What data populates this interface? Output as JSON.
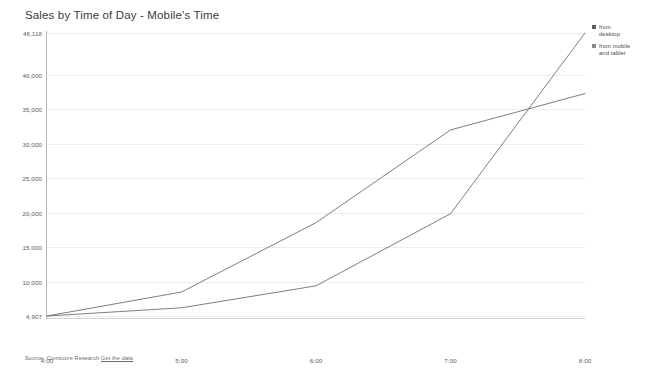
{
  "chart_data": {
    "type": "line",
    "title": "Sales by Time of Day - Mobile's Time",
    "xlabel": "",
    "ylabel": "",
    "x": [
      "4:00",
      "5:00",
      "6:00",
      "7:00",
      "8:00"
    ],
    "categories": [
      "4:00",
      "5:00",
      "6:00",
      "7:00",
      "8:00"
    ],
    "ylim": [
      4907,
      46118
    ],
    "ytick_labels": [
      "46,118",
      "40,000",
      "35,000",
      "30,000",
      "25,000",
      "20,000",
      "15,000",
      "10,000",
      "4,907"
    ],
    "ytick_values": [
      46118,
      40000,
      35000,
      30000,
      25000,
      20000,
      15000,
      10000,
      4907
    ],
    "grid": true,
    "legend_position": "right",
    "series": [
      {
        "name": "from desktop",
        "color": "#6f6f6f",
        "values": [
          4907,
          6100,
          9300,
          19800,
          46118
        ]
      },
      {
        "name": "from mobile and tablet",
        "color": "#6f6f6f",
        "values": [
          4907,
          8400,
          18500,
          32000,
          37300
        ]
      }
    ],
    "axis_min_label": "4,907",
    "axis_max_label": "46,118"
  },
  "legend": {
    "items": [
      {
        "label_line1": "from",
        "label_line2": "desktop",
        "swatch_color": "#5e5e5e"
      },
      {
        "label_line1": "from mobile",
        "label_line2": "and tablet",
        "swatch_color": "#8a8a8a"
      }
    ]
  },
  "footer": {
    "source_prefix": "Source: Comscore Research",
    "get_data_link": "Get the data"
  }
}
